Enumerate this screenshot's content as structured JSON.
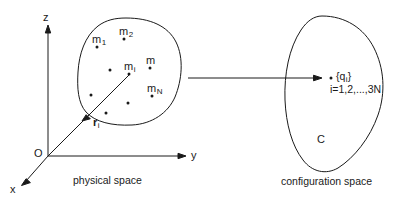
{
  "figure": {
    "stroke_color": "#1a1a1a",
    "background": "#ffffff",
    "panels": {
      "left": {
        "caption": "physical space",
        "axes": {
          "z_label": "z",
          "y_label": "y",
          "x_label": "x",
          "origin_label": "O"
        },
        "vector": {
          "symbol": "r",
          "subscript": "i"
        },
        "masses": [
          {
            "label": "m",
            "subscript": "1"
          },
          {
            "label": "m",
            "subscript": "2"
          },
          {
            "label": "m",
            "subscript": ""
          },
          {
            "label": "m",
            "subscript": "i"
          },
          {
            "label": "m",
            "subscript": "N"
          }
        ],
        "unlabeled_point_count": 4
      },
      "right": {
        "caption": "configuration space",
        "region_label": "C",
        "coordinate_set": {
          "open_brace": "{",
          "symbol": "q",
          "subscript": "i",
          "close_brace": "}"
        },
        "index_range": "i=1,2,...,3N"
      }
    }
  }
}
